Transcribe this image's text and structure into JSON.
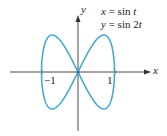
{
  "chart_data": {
    "type": "line",
    "title": "",
    "parametric": true,
    "equations": [
      "x = sin t",
      "y = sin 2t"
    ],
    "xlabel": "x",
    "ylabel": "y",
    "x_ticks": [
      "-1",
      "1"
    ],
    "xlim": [
      -1.1,
      1.1
    ],
    "ylim": [
      -1.1,
      1.1
    ],
    "series": [
      {
        "name": "x = sin t, y = sin 2t",
        "color": "#4aa9d4",
        "points": [
          [
            0,
            0
          ],
          [
            0.38,
            0.71
          ],
          [
            0.71,
            1.0
          ],
          [
            0.92,
            0.71
          ],
          [
            1,
            0
          ],
          [
            0.92,
            -0.71
          ],
          [
            0.71,
            -1.0
          ],
          [
            0.38,
            -0.71
          ],
          [
            0,
            0
          ],
          [
            -0.38,
            0.71
          ],
          [
            -0.71,
            1.0
          ],
          [
            -0.92,
            0.71
          ],
          [
            -1,
            0
          ],
          [
            -0.92,
            -0.71
          ],
          [
            -0.71,
            -1.0
          ],
          [
            -0.38,
            -0.71
          ],
          [
            0,
            0
          ]
        ]
      }
    ],
    "grid": false
  },
  "labels": {
    "eq1_lhs": "x",
    "eq1_rhs": " = sin ",
    "eq1_var": "t",
    "eq2_lhs": "y",
    "eq2_rhs": " = sin 2",
    "eq2_var": "t",
    "x_axis": "x",
    "y_axis": "y",
    "tick_neg1": "−1",
    "tick_pos1": "1"
  }
}
